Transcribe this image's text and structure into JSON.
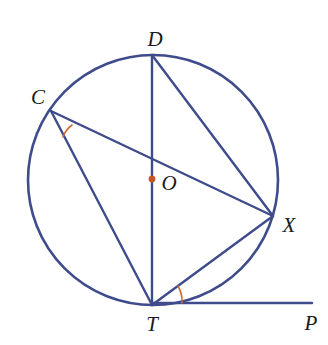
{
  "figure": {
    "type": "circle-geometry-diagram",
    "background_color": "#ffffff",
    "width": 328,
    "height": 345
  },
  "style": {
    "stroke_color": "#3f4c8c",
    "stroke_width": 2.4,
    "circle_stroke_width": 2.6,
    "angle_mark_color": "#cf6b2e",
    "angle_mark_width": 1.6,
    "center_dot_color": "#c8562a",
    "center_dot_radius": 3.4,
    "label_color": "#1a1a1a",
    "label_font_size": 21
  },
  "circle": {
    "name": "main-circle",
    "cx": 153,
    "cy": 180,
    "r": 125
  },
  "center_point": {
    "name": "O",
    "x": 152,
    "y": 179
  },
  "points": [
    {
      "name": "D",
      "x": 152,
      "y": 55,
      "label": "D",
      "label_x": 155,
      "label_y": 46
    },
    {
      "name": "C",
      "x": 51,
      "y": 111,
      "label": "C",
      "label_x": 38,
      "label_y": 104
    },
    {
      "name": "X",
      "x": 273,
      "y": 216,
      "label": "X",
      "label_x": 289,
      "label_y": 232
    },
    {
      "name": "T",
      "x": 152,
      "y": 305,
      "label": "T",
      "label_x": 152,
      "label_y": 331
    },
    {
      "name": "O",
      "x": 152,
      "y": 179,
      "label": "O",
      "label_x": 169,
      "label_y": 190
    },
    {
      "name": "P",
      "x": 312,
      "y": 303,
      "label": "P",
      "label_x": 311,
      "label_y": 330
    }
  ],
  "segments": [
    {
      "name": "chord-DT",
      "from": "D",
      "to": "T",
      "x1": 152,
      "y1": 55,
      "x2": 152,
      "y2": 305
    },
    {
      "name": "chord-DX",
      "from": "D",
      "to": "X",
      "x1": 152,
      "y1": 55,
      "x2": 273,
      "y2": 216
    },
    {
      "name": "chord-CX",
      "from": "C",
      "to": "X",
      "x1": 51,
      "y1": 111,
      "x2": 273,
      "y2": 216
    },
    {
      "name": "chord-CT",
      "from": "C",
      "to": "T",
      "x1": 51,
      "y1": 111,
      "x2": 152,
      "y2": 305
    },
    {
      "name": "chord-TX",
      "from": "T",
      "to": "X",
      "x1": 152,
      "y1": 305,
      "x2": 273,
      "y2": 216
    },
    {
      "name": "tangent-TP",
      "from": "T",
      "to": "P",
      "x1": 152,
      "y1": 303,
      "x2": 312,
      "y2": 303
    }
  ],
  "angle_marks": [
    {
      "name": "angle-mark-at-C",
      "vertex": "C",
      "between": [
        "CX",
        "CT"
      ],
      "path": "M 72 125 A 26 26 0 0 0 63 137"
    },
    {
      "name": "angle-mark-at-T",
      "vertex": "T",
      "between": [
        "TX",
        "TP"
      ],
      "path": "M 178 286 A 30 30 0 0 1 182 303"
    }
  ]
}
